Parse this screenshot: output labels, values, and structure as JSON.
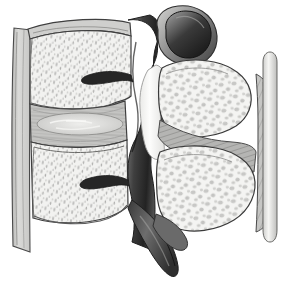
{
  "figure": {
    "style": "grayscale medical illustration, stippled cancellous bone",
    "background_color": "#ffffff",
    "outline_color": "#3a3a3a",
    "width": 294,
    "height": 285
  },
  "palette": {
    "background": "#ffffff",
    "bone_cortical_light": "#f2f2f0",
    "bone_cancellous_fill": "#e8e8e6",
    "stipple_gray": "#a8a8a6",
    "cartilage_mid_gray": "#b9b9b7",
    "disc_gray": "#c2c2c0",
    "nucleus_light": "#dcdcda",
    "posterior_dark": "#4a4a4a",
    "canal_darkest": "#1d1d1d",
    "ligament_hatch": "#9a9a98",
    "nerve_root_light": "#fbfbfa",
    "outline": "#3a3a3a"
  },
  "structures": [
    {
      "id": "anterior-longitudinal-ligament",
      "label": "Anterior longitudinal ligament",
      "side": "left",
      "tone": "#cfcfcd"
    },
    {
      "id": "vertebral-body-upper",
      "label": "Upper vertebral body (cut, cancellous bone)",
      "tone": "#f1f1ef"
    },
    {
      "id": "vertebral-body-lower",
      "label": "Lower vertebral body (cut, cancellous bone)",
      "tone": "#f1f1ef"
    },
    {
      "id": "intervertebral-disc",
      "label": "Intervertebral disc (annulus fibrosus)",
      "tone": "#c2c2c0"
    },
    {
      "id": "nucleus-pulposus",
      "label": "Nucleus pulposus",
      "tone": "#dedede"
    },
    {
      "id": "basivertebral-foramen-upper",
      "label": "Basivertebral vein foramen (upper)",
      "tone": "#2a2a2a"
    },
    {
      "id": "basivertebral-foramen-lower",
      "label": "Basivertebral vein foramen (lower)",
      "tone": "#2a2a2a"
    },
    {
      "id": "pedicle",
      "label": "Pedicle",
      "tone": "#6a6a6a"
    },
    {
      "id": "vertebral-canal",
      "label": "Vertebral canal / spinal canal",
      "tone": "#1d1d1d"
    },
    {
      "id": "intervertebral-foramen",
      "label": "Intervertebral foramen with nerve root",
      "tone": "#fbfbfa"
    },
    {
      "id": "superior-articular-process",
      "label": "Superior articular process",
      "tone": "#5a5a5a"
    },
    {
      "id": "facet-joint",
      "label": "Zygapophysial (facet) joint surface",
      "tone": "#222222"
    },
    {
      "id": "lamina-upper",
      "label": "Lamina (upper, cut showing cancellous bone)",
      "tone": "#f4f4f2"
    },
    {
      "id": "lamina-lower",
      "label": "Lamina (lower, cut showing cancellous bone)",
      "tone": "#f4f4f2"
    },
    {
      "id": "ligamentum-flavum",
      "label": "Ligamentum flavum (striated)",
      "tone": "#b4b4b2"
    },
    {
      "id": "spinous-process",
      "label": "Spinous process",
      "tone": "#555555"
    },
    {
      "id": "supraspinous-ligament",
      "label": "Supraspinous ligament",
      "tone": "#9d9d9b"
    },
    {
      "id": "interspinous-ligament",
      "label": "Interspinous ligament (hatched sheet)",
      "tone": "#8f8f8d"
    }
  ]
}
